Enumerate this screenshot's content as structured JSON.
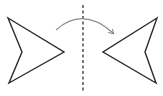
{
  "diagram": {
    "type": "reflection",
    "description": "Arrowhead shape reflected across a vertical dashed mirror line",
    "colors": {
      "shape_stroke": "#2b2b2b",
      "mirror_line": "#333333",
      "arc_arrow": "#8a8a8a",
      "background": "#ffffff"
    },
    "original_shape": {
      "points": [
        [
          8,
          18
        ],
        [
          64,
          52
        ],
        [
          9,
          83
        ],
        [
          22,
          52
        ]
      ],
      "orientation": "pointing-right"
    },
    "mirror_line": {
      "x": 83,
      "y1": 5,
      "y2": 92,
      "style": "dashed"
    },
    "reflected_shape": {
      "points": [
        [
          157,
          18
        ],
        [
          103,
          52
        ],
        [
          156,
          83
        ],
        [
          145,
          52
        ]
      ],
      "orientation": "pointing-left"
    },
    "arc_arrow": {
      "from": [
        56,
        30
      ],
      "control": [
        83,
        6
      ],
      "to": [
        113,
        33
      ],
      "direction": "left-to-right"
    }
  }
}
